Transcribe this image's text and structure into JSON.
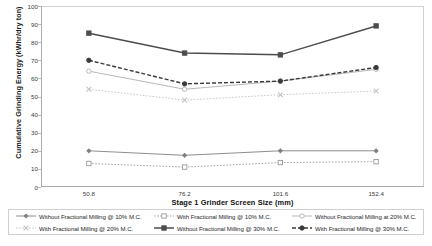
{
  "chart_data": {
    "type": "line",
    "title": "",
    "xlabel": "Stage 1 Grinder Screen Size (mm)",
    "ylabel": "Cumulative Grinding Energy (kWhr/dry ton)",
    "categories": [
      "50.8",
      "76.2",
      "101.6",
      "152.4"
    ],
    "x": [
      50.8,
      76.2,
      101.6,
      152.4
    ],
    "ylim": [
      0,
      100
    ],
    "yticks": [
      0,
      10,
      20,
      30,
      40,
      50,
      60,
      70,
      80,
      90,
      100
    ],
    "grid": false,
    "legend_position": "bottom",
    "series": [
      {
        "name": "Without Fractional Milling @ 10% M.C.",
        "values": [
          20,
          17.5,
          20,
          20
        ],
        "color": "#808080",
        "marker": "diamond",
        "dash": "solid"
      },
      {
        "name": "With Fractional Milling @ 10% M.C.",
        "values": [
          13,
          11,
          13.5,
          14
        ],
        "color": "#9a9a9a",
        "marker": "square-open",
        "dash": "dotted"
      },
      {
        "name": "Without Fractional Milling at 20% M.C.",
        "values": [
          64,
          54,
          58.5,
          65
        ],
        "color": "#b0b0b0",
        "marker": "circle-open",
        "dash": "solid"
      },
      {
        "name": "With Fractional Milling @ 20% M.C.",
        "values": [
          54,
          48,
          51,
          53
        ],
        "color": "#c2c2c2",
        "marker": "cross",
        "dash": "dotted"
      },
      {
        "name": "Without Fractional Milling @ 30% M.C.",
        "values": [
          85,
          74,
          73,
          89
        ],
        "color": "#4d4d4d",
        "marker": "square",
        "dash": "solid"
      },
      {
        "name": "With Fractional Milling @ 30% M.C.",
        "values": [
          70,
          57,
          58.5,
          66
        ],
        "color": "#3a3a3a",
        "marker": "circle",
        "dash": "dashed"
      }
    ]
  },
  "axes": {
    "y_ticks": [
      "0",
      "10",
      "20",
      "30",
      "40",
      "50",
      "60",
      "70",
      "80",
      "90",
      "100"
    ],
    "y_title": "Cumulative Grinding Energy (kWhr/dry ton)",
    "x_ticks": [
      "50.8",
      "76.2",
      "101.6",
      "152.4"
    ],
    "x_title": "Stage 1 Grinder Screen Size (mm)"
  },
  "legend": {
    "items": [
      "Without Fractional Milling @ 10% M.C.",
      "With Fractional Milling @ 10% M.C.",
      "Without Fractional Milling at 20% M.C.",
      "With Fractional Milling @ 20% M.C.",
      "Without Fractional Milling @ 30% M.C.",
      "With Fractional Milling @ 30% M.C."
    ]
  },
  "caption": ""
}
